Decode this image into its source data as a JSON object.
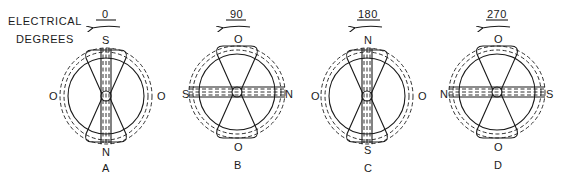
{
  "title": {
    "line1": "ELECTRICAL",
    "line2": "DEGREES"
  },
  "diagrams": [
    {
      "id": "A",
      "degrees": "0",
      "top": "S",
      "bottom": "N",
      "left": "O",
      "right": "O",
      "field": "vertical"
    },
    {
      "id": "B",
      "degrees": "90",
      "top": "O",
      "bottom": "O",
      "left": "S",
      "right": "N",
      "field": "horizontal"
    },
    {
      "id": "C",
      "degrees": "180",
      "top": "N",
      "bottom": "S",
      "left": "O",
      "right": "O",
      "field": "vertical"
    },
    {
      "id": "D",
      "degrees": "270",
      "top": "O",
      "bottom": "O",
      "left": "N",
      "right": "S",
      "field": "horizontal"
    }
  ],
  "rotation_arrow": "counterclockwise-arrow"
}
